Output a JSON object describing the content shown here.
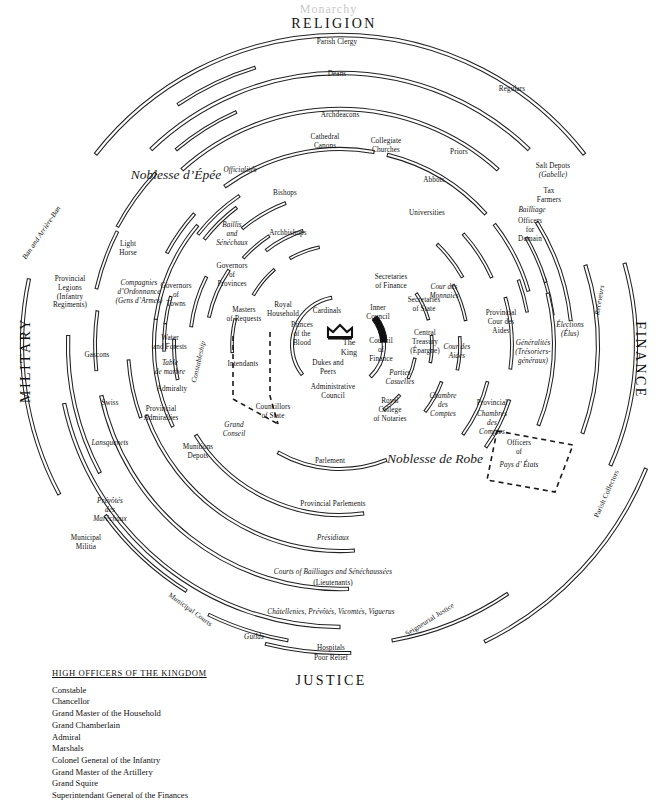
{
  "document": {
    "cut_off_title": "Monarchy",
    "center_label": "The King"
  },
  "sectors": [
    {
      "name": "religion",
      "label": "RELIGION",
      "x": 334,
      "y": 24,
      "rotate": 0
    },
    {
      "name": "military",
      "label": "MILITARY",
      "x": 26,
      "y": 360,
      "rotate": -90
    },
    {
      "name": "finance",
      "label": "FINANCE",
      "x": 640,
      "y": 360,
      "rotate": 90
    },
    {
      "name": "justice",
      "label": "JUSTICE",
      "x": 331,
      "y": 681,
      "rotate": 0
    }
  ],
  "estates": [
    {
      "name": "noblesse-depee",
      "label": "Noblesse d’Épée",
      "x": 176,
      "y": 175
    },
    {
      "name": "noblesse-de-robe",
      "label": "Noblesse de Robe",
      "x": 435,
      "y": 459
    }
  ],
  "center": {
    "king": "The King",
    "crown_icon": "crown-icon",
    "nodes": [
      {
        "name": "cardinals",
        "label": "Cardinals",
        "x": 327,
        "y": 311,
        "italic": false
      },
      {
        "name": "princes-of-the-blood",
        "label": "Princes\nof the\nBlood",
        "x": 302,
        "y": 334,
        "italic": false
      },
      {
        "name": "dukes-and-peers",
        "label": "Dukes and\nPeers",
        "x": 328,
        "y": 368,
        "italic": false
      },
      {
        "name": "administrative-council",
        "label": "Administrative\nCouncil",
        "x": 333,
        "y": 392,
        "italic": false
      },
      {
        "name": "royal-household",
        "label": "Royal\nHousehold",
        "x": 283,
        "y": 310,
        "italic": false
      },
      {
        "name": "inner-council",
        "label": "Inner\nCouncil",
        "x": 378,
        "y": 313,
        "italic": false
      },
      {
        "name": "council-of-finance",
        "label": "Council\nof\nFinance",
        "x": 381,
        "y": 350,
        "italic": false
      }
    ]
  },
  "religion_nodes": [
    {
      "name": "parish-clergy",
      "label": "Parish Clergy",
      "x": 337,
      "y": 42
    },
    {
      "name": "deans",
      "label": "Deans",
      "x": 337,
      "y": 74
    },
    {
      "name": "archdeacons",
      "label": "Archdeacons",
      "x": 340,
      "y": 115
    },
    {
      "name": "cathedral-canons",
      "label": "Cathedral\nCanons",
      "x": 325,
      "y": 142
    },
    {
      "name": "collegiate-churches",
      "label": "Collegiate\nChurches",
      "x": 386,
      "y": 146
    },
    {
      "name": "regulars",
      "label": "Regulars",
      "x": 512,
      "y": 89
    },
    {
      "name": "priors",
      "label": "Priors",
      "x": 459,
      "y": 152
    },
    {
      "name": "abbots",
      "label": "Abbots",
      "x": 434,
      "y": 180
    },
    {
      "name": "universities",
      "label": "Universities",
      "x": 427,
      "y": 213
    },
    {
      "name": "officialites",
      "label": "Officialités",
      "x": 240,
      "y": 170,
      "italic": true
    },
    {
      "name": "bishops",
      "label": "Bishops",
      "x": 285,
      "y": 193
    },
    {
      "name": "archbishops",
      "label": "Archbishops",
      "x": 288,
      "y": 233
    }
  ],
  "military_nodes": [
    {
      "name": "ban-and-arriere-ban",
      "label": "Ban and Arrière-Ban",
      "x": 42,
      "y": 233,
      "italic": true,
      "rotate": -56
    },
    {
      "name": "provincial-legions",
      "label": "Provincial\nLegions\n(Infantry\nRegiments)",
      "x": 70,
      "y": 293
    },
    {
      "name": "light-horse",
      "label": "Light\nHorse",
      "x": 128,
      "y": 249
    },
    {
      "name": "compagnies-dordonnance",
      "label": "Compagnies\nd’Ordonnance\n(Gens d’Armes)",
      "x": 139,
      "y": 292,
      "italic": true
    },
    {
      "name": "governors-of-towns",
      "label": "Governors\nof\nTowns",
      "x": 176,
      "y": 295
    },
    {
      "name": "baillis-et-senechaux",
      "label": "Baillis\nand\nSénéchaux",
      "x": 232,
      "y": 234,
      "italic": true
    },
    {
      "name": "governors-of-provinces",
      "label": "Governors\nof\nProvinces",
      "x": 232,
      "y": 275
    },
    {
      "name": "gascons",
      "label": "Gascons",
      "x": 97,
      "y": 355
    },
    {
      "name": "swiss",
      "label": "Swiss",
      "x": 110,
      "y": 403
    },
    {
      "name": "lansquenets",
      "label": "Lansquenets",
      "x": 110,
      "y": 443,
      "italic": true
    },
    {
      "name": "water-and-forests",
      "label": "Water\nand Forests",
      "x": 170,
      "y": 343
    },
    {
      "name": "table-de-marbre",
      "label": "Table\nde marbre",
      "x": 170,
      "y": 368,
      "italic": true
    },
    {
      "name": "admiralty",
      "label": "Admiralty",
      "x": 172,
      "y": 389
    },
    {
      "name": "constableship",
      "label": "Constableship",
      "x": 199,
      "y": 362,
      "italic": true,
      "rotate": -77
    },
    {
      "name": "provincial-admiralties",
      "label": "Provincial\nAdmiralties",
      "x": 161,
      "y": 414
    },
    {
      "name": "munitions-depots",
      "label": "Munitions\nDepots",
      "x": 198,
      "y": 452
    },
    {
      "name": "prevotes-des-marechaux",
      "label": "Prévôtés\ndes\nMaréchaux",
      "x": 110,
      "y": 510,
      "italic": true
    },
    {
      "name": "municipal-militia",
      "label": "Municipal\nMilitia",
      "x": 86,
      "y": 543
    },
    {
      "name": "masters-of-requests",
      "label": "Masters\nof Requests",
      "x": 244,
      "y": 315
    },
    {
      "name": "intendants",
      "label": "Intendants",
      "x": 243,
      "y": 364
    },
    {
      "name": "councillors-of-state",
      "label": "Councillors\nof State",
      "x": 273,
      "y": 412
    },
    {
      "name": "grand-conseil",
      "label": "Grand\nConseil",
      "x": 234,
      "y": 430,
      "italic": true
    }
  ],
  "finance_nodes": [
    {
      "name": "salt-depots",
      "label": "Salt Depots",
      "x": 553,
      "y": 166
    },
    {
      "name": "gabelle",
      "label": "(Gabelle)",
      "x": 553,
      "y": 175,
      "italic": true
    },
    {
      "name": "tax-farmers",
      "label": "Tax\nFarmers",
      "x": 549,
      "y": 196
    },
    {
      "name": "bailliage-officers-for-domain",
      "label": "Bailliage",
      "x": 532,
      "y": 210,
      "italic": true
    },
    {
      "name": "officers-for-domain",
      "label": "Officers\nfor\nDomain",
      "x": 530,
      "y": 230
    },
    {
      "name": "receveurs",
      "label": "Receveurs",
      "x": 600,
      "y": 300,
      "italic": true,
      "rotate": -80
    },
    {
      "name": "elections",
      "label": "Élections\n(Élus)",
      "x": 570,
      "y": 330,
      "italic": true
    },
    {
      "name": "generalites",
      "label": "Généralités\n(Trésoriers-\ngénéraux)",
      "x": 533,
      "y": 352,
      "italic": true
    },
    {
      "name": "provincial-cour-des-aides",
      "label": "Provincial\nCour des\nAides",
      "x": 501,
      "y": 322,
      "italic": false
    },
    {
      "name": "cour-des-monnaies",
      "label": "Cour des\nMonnaies",
      "x": 444,
      "y": 292,
      "italic": true
    },
    {
      "name": "cour-des-aides",
      "label": "Cour des\nAides",
      "x": 457,
      "y": 352,
      "italic": true
    },
    {
      "name": "secretaries-of-finance",
      "label": "Secretaries\nof Finance",
      "x": 391,
      "y": 282
    },
    {
      "name": "secretaries-of-state",
      "label": "Secretaries\nof State",
      "x": 424,
      "y": 305
    },
    {
      "name": "central-treasury",
      "label": "Central\nTreasury\n(Épargne)",
      "x": 425,
      "y": 342
    },
    {
      "name": "parties-casuelles",
      "label": "Parties\nCasuelles",
      "x": 400,
      "y": 378,
      "italic": true
    },
    {
      "name": "chambre-des-comptes",
      "label": "Chambre\ndes\nComptes",
      "x": 443,
      "y": 405,
      "italic": true
    },
    {
      "name": "provincial-chambres-des-comptes",
      "label": "Provincial",
      "x": 492,
      "y": 403
    },
    {
      "name": "chambres-des-comptes-prov",
      "label": "Chambres\ndes\nComptes",
      "x": 492,
      "y": 423,
      "italic": true
    },
    {
      "name": "officers-of-pays-detats",
      "label": "Officers\nof",
      "x": 519,
      "y": 448
    },
    {
      "name": "pays-detats",
      "label": "Pays d’ États",
      "x": 519,
      "y": 465,
      "italic": true
    },
    {
      "name": "parish-collectors",
      "label": "Parish Collectors",
      "x": 607,
      "y": 494,
      "rotate": -66
    }
  ],
  "justice_nodes": [
    {
      "name": "royal-college-of-notaries",
      "label": "Royal\nCollege\nof Notaries",
      "x": 390,
      "y": 410
    },
    {
      "name": "parlement",
      "label": "Parlement",
      "x": 330,
      "y": 461
    },
    {
      "name": "provincial-parlements",
      "label": "Provincial Parlements",
      "x": 333,
      "y": 504
    },
    {
      "name": "presidiaux",
      "label": "Présidiaux",
      "x": 333,
      "y": 538,
      "italic": true
    },
    {
      "name": "courts-of-bailliages",
      "label": "Courts of Bailliages and Sénéchaussées",
      "x": 333,
      "y": 572,
      "italic": true
    },
    {
      "name": "lieutenants",
      "label": "(Lieutenants)",
      "x": 333,
      "y": 583
    },
    {
      "name": "chatellenies",
      "label": "Châtellenies, Prévôtés, Vicomtés, Viguerus",
      "x": 331,
      "y": 612,
      "italic": true
    },
    {
      "name": "municipal-courts",
      "label": "Municipal Courts",
      "x": 190,
      "y": 610,
      "rotate": 36
    },
    {
      "name": "guilds",
      "label": "Guilds",
      "x": 254,
      "y": 637,
      "italic": true
    },
    {
      "name": "hospitals",
      "label": "Hospitals",
      "x": 331,
      "y": 648
    },
    {
      "name": "poor-relief",
      "label": "Poor Relief",
      "x": 331,
      "y": 658
    },
    {
      "name": "seigneurial-justice",
      "label": "Seigneurial Justice",
      "x": 430,
      "y": 620,
      "rotate": -32
    }
  ],
  "legend": {
    "title": "HIGH OFFICERS OF THE KINGDOM",
    "items": [
      "Constable",
      "Chancellor",
      "Grand Master of the Household",
      "Grand Chamberlain",
      "Admiral",
      "Marshals",
      "Colonel General of the Infantry",
      "Grand Master of the Artillery",
      "Grand Squire",
      "Superintendant General of the Finances"
    ]
  },
  "colors": {
    "ink": "#1a1a1a",
    "background": "#ffffff",
    "arc_stroke": "#222222"
  }
}
